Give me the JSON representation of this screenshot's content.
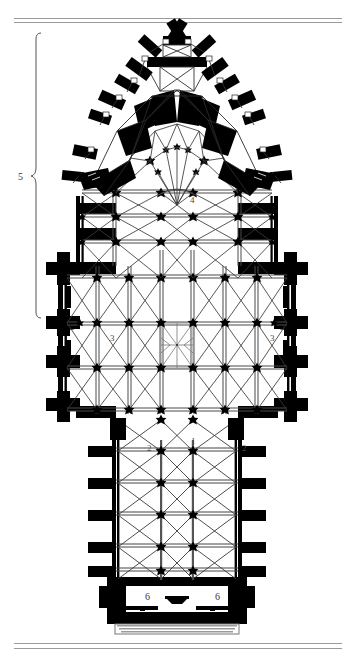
{
  "figure": {
    "background_color": "#ffffff",
    "ink_color": "#000000",
    "rule_color": "#9a9a9a",
    "label_color": "#4a4a4a"
  },
  "rules": {
    "top_outer_label": "top-rule-outer",
    "top_inner_label": "top-rule-inner",
    "bottom_outer_label": "bottom-rule-outer",
    "bottom_inner_label": "bottom-rule-inner"
  },
  "bracket": {
    "label": "5",
    "name": "chevet-choir-brace"
  },
  "keys": [
    {
      "id": "k1",
      "label": "1",
      "x": 191,
      "y": 437,
      "name": "key-label-nave"
    },
    {
      "id": "k2l",
      "label": "2",
      "x": 147,
      "y": 444,
      "name": "key-label-aisle-left"
    },
    {
      "id": "k2r",
      "label": "2",
      "x": 242,
      "y": 444,
      "name": "key-label-aisle-right"
    },
    {
      "id": "k3l",
      "label": "3",
      "x": 110,
      "y": 334,
      "name": "key-label-transept-left"
    },
    {
      "id": "k3r",
      "label": "3",
      "x": 270,
      "y": 334,
      "name": "key-label-transept-right"
    },
    {
      "id": "k4",
      "label": "4",
      "x": 190,
      "y": 196,
      "name": "key-label-choir"
    },
    {
      "id": "k6l",
      "label": "6",
      "x": 145,
      "y": 597,
      "name": "key-label-tower-left"
    },
    {
      "id": "k6r",
      "label": "6",
      "x": 242,
      "y": 597,
      "name": "key-label-tower-right"
    }
  ]
}
